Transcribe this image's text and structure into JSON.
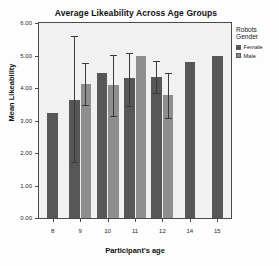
{
  "chart_data": {
    "type": "bar",
    "title": "Average Likeability Across Age Groups",
    "xlabel": "Participant's age",
    "ylabel": "Mean Likeability",
    "categories": [
      "8",
      "9",
      "10",
      "11",
      "12",
      "14",
      "15"
    ],
    "ylim": [
      0,
      6
    ],
    "ytick_labels": [
      "0.00",
      "1.00",
      "2.00",
      "3.00",
      "4.00",
      "5.00",
      "6.00"
    ],
    "ytick_values": [
      0,
      1,
      2,
      3,
      4,
      5,
      6
    ],
    "grid": false,
    "legend_position": "right",
    "legend_title": "Robots Gender",
    "series": [
      {
        "name": "Female",
        "color": "#575757",
        "values": [
          3.22,
          3.63,
          4.47,
          4.3,
          4.33,
          4.8,
          5.0
        ],
        "error_low": [
          null,
          1.68,
          null,
          3.4,
          3.82,
          null,
          null
        ],
        "error_high": [
          null,
          5.6,
          null,
          5.08,
          4.83,
          null,
          null
        ]
      },
      {
        "name": "Male",
        "color": "#8e8e8e",
        "values": [
          null,
          4.12,
          4.08,
          5.0,
          3.77,
          null,
          null
        ],
        "error_low": [
          null,
          3.45,
          3.1,
          null,
          3.05,
          null,
          null
        ],
        "error_high": [
          null,
          4.78,
          5.03,
          null,
          4.45,
          null,
          null
        ]
      }
    ]
  },
  "legend": {
    "title": "Robots Gender",
    "title_line1": "Robots",
    "title_line2": "Gender",
    "items": [
      {
        "label": "Female",
        "color": "#575757"
      },
      {
        "label": "Male",
        "color": "#8e8e8e"
      }
    ]
  },
  "colors": {
    "female_bar": "#575757",
    "male_bar": "#8e8e8e",
    "plot_background": "#f1f1f1",
    "axis_line": "#4a4a4a",
    "page_background": "#fdfdfd",
    "text": "#1c1c1c"
  }
}
